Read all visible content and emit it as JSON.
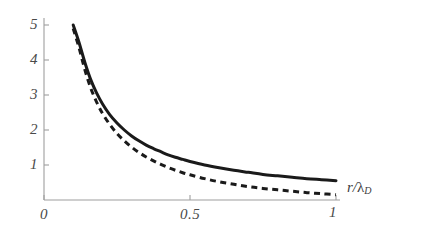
{
  "chart_data": {
    "type": "line",
    "title": "",
    "subtitle": "",
    "xlabel": "r/λ_D",
    "ylabel": "",
    "xlim": [
      0,
      1.05
    ],
    "ylim": [
      0,
      5.2
    ],
    "grid": false,
    "legend": "none",
    "xticks": [
      0,
      0.5,
      1
    ],
    "xticklabels": [
      "0",
      "0.5",
      "1"
    ],
    "yticks": [
      1,
      2,
      3,
      4,
      5
    ],
    "yticklabels": [
      "1",
      "2",
      "3",
      "4",
      "5"
    ],
    "x": [
      0.1,
      0.12,
      0.14,
      0.16,
      0.18,
      0.2,
      0.225,
      0.25,
      0.275,
      0.3,
      0.325,
      0.35,
      0.375,
      0.4,
      0.425,
      0.45,
      0.475,
      0.5,
      0.55,
      0.6,
      0.65,
      0.7,
      0.75,
      0.8,
      0.85,
      0.9,
      0.95,
      1.0
    ],
    "series": [
      {
        "name": "unscreened-coulomb",
        "style": "solid",
        "color": "#1a1a1a",
        "linewidth": 3.0,
        "values": [
          5.0,
          4.5,
          3.93,
          3.44,
          3.06,
          2.75,
          2.44,
          2.2,
          2.0,
          1.83,
          1.69,
          1.57,
          1.47,
          1.38,
          1.29,
          1.22,
          1.16,
          1.1,
          1.0,
          0.92,
          0.85,
          0.79,
          0.73,
          0.69,
          0.65,
          0.61,
          0.58,
          0.55
        ]
      },
      {
        "name": "debye-screened-coulomb",
        "style": "dashed",
        "color": "#1a1a1a",
        "linewidth": 3.0,
        "values": [
          4.9,
          4.35,
          3.72,
          3.2,
          2.8,
          2.48,
          2.16,
          1.9,
          1.69,
          1.51,
          1.36,
          1.23,
          1.12,
          1.02,
          0.93,
          0.85,
          0.78,
          0.72,
          0.61,
          0.52,
          0.45,
          0.38,
          0.33,
          0.29,
          0.25,
          0.21,
          0.18,
          0.15
        ]
      }
    ]
  },
  "axes": {
    "x_axis_label": {
      "numerator": "r",
      "slash": "/",
      "lambda": "λ",
      "subscript": "D"
    },
    "y_tick_labels": [
      "5",
      "4",
      "3",
      "2",
      "1"
    ],
    "x_tick_labels": [
      "0",
      "0.5",
      "1"
    ],
    "colors": {
      "axis": "#9a9a9a",
      "tick_text": "#4a4a4a",
      "curve": "#1a1a1a",
      "background": "#ffffff"
    }
  }
}
